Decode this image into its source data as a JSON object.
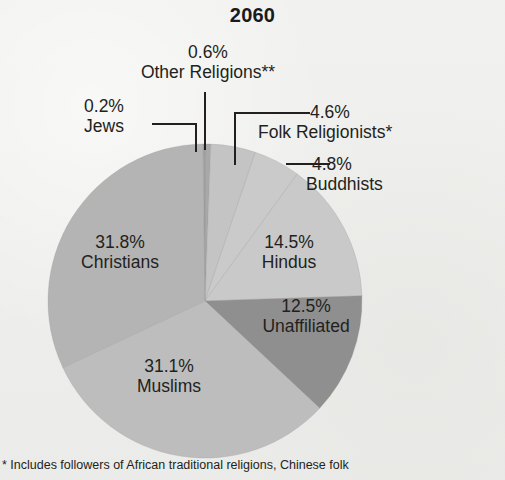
{
  "chart_data": {
    "type": "pie",
    "title": "2060",
    "xlabel": "",
    "ylabel": "",
    "legend_position": "none",
    "grid": false,
    "unit": "%",
    "categories": [
      "Other Religions**",
      "Folk Religionists*",
      "Buddhists",
      "Hindus",
      "Unaffiliated",
      "Muslims",
      "Christians",
      "Jews"
    ],
    "values": [
      0.6,
      4.6,
      4.8,
      14.5,
      12.5,
      31.1,
      31.8,
      0.2
    ],
    "colors": [
      "#a8a8a8",
      "#c4c4c4",
      "#cacaca",
      "#c9c9c9",
      "#8f8f8f",
      "#bdbdbd",
      "#b4b4b4",
      "#9e9e9e"
    ],
    "slices": [
      {
        "label": "Other Religions**",
        "value": 0.6,
        "value_text": "0.6%",
        "color": "#a8a8a8",
        "placement": "callout"
      },
      {
        "label": "Folk Religionists*",
        "value": 4.6,
        "value_text": "4.6%",
        "color": "#c4c4c4",
        "placement": "callout"
      },
      {
        "label": "Buddhists",
        "value": 4.8,
        "value_text": "4.8%",
        "color": "#cacaca",
        "placement": "callout"
      },
      {
        "label": "Hindus",
        "value": 14.5,
        "value_text": "14.5%",
        "color": "#c9c9c9",
        "placement": "inside"
      },
      {
        "label": "Unaffiliated",
        "value": 12.5,
        "value_text": "12.5%",
        "color": "#8f8f8f",
        "placement": "inside"
      },
      {
        "label": "Muslims",
        "value": 31.1,
        "value_text": "31.1%",
        "color": "#bdbdbd",
        "placement": "inside"
      },
      {
        "label": "Christians",
        "value": 31.8,
        "value_text": "31.8%",
        "color": "#b4b4b4",
        "placement": "inside"
      },
      {
        "label": "Jews",
        "value": 0.2,
        "value_text": "0.2%",
        "color": "#9e9e9e",
        "placement": "callout"
      }
    ]
  },
  "title": "2060",
  "callouts": {
    "other_religions": {
      "pct": "0.6%",
      "name": "Other Religions**"
    },
    "jews": {
      "pct": "0.2%",
      "name": "Jews"
    },
    "folk": {
      "pct": "4.6%",
      "name": "Folk Religionists*"
    },
    "buddhists": {
      "pct": "4.8%",
      "name": "Buddhists"
    }
  },
  "inside_labels": {
    "christians": {
      "pct": "31.8%",
      "name": "Christians"
    },
    "hindus": {
      "pct": "14.5%",
      "name": "Hindus"
    },
    "unaffiliated": {
      "pct": "12.5%",
      "name": "Unaffiliated"
    },
    "muslims": {
      "pct": "31.1%",
      "name": "Muslims"
    }
  },
  "footnote": "* Includes followers of African traditional religions, Chinese folk"
}
